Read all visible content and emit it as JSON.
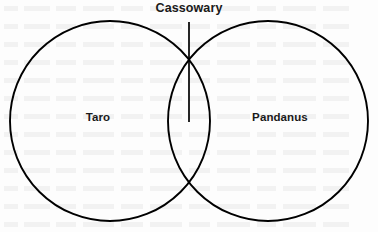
{
  "figure": {
    "type": "venn-diagram",
    "background_color": "#fdfdfd",
    "stroke_color": "#000000",
    "text_color": "#1a1a1a"
  },
  "chart_data": {
    "type": "diagram",
    "diagram_type": "venn",
    "title": "",
    "sets": [
      {
        "id": "taro",
        "label": "Taro",
        "center_x": 110,
        "center_y": 121,
        "radius": 100,
        "fill": "none",
        "stroke": "#000000"
      },
      {
        "id": "pandanus",
        "label": "Pandanus",
        "center_x": 268,
        "center_y": 121,
        "radius": 100,
        "fill": "none",
        "stroke": "#000000"
      }
    ],
    "intersection": {
      "label": "Cassowary",
      "label_x": 190,
      "label_y": 9,
      "leader_line": {
        "x": 189,
        "y_start": 22,
        "y_end": 122
      },
      "upper_crossing": {
        "x": 189,
        "y": 68
      },
      "lower_crossing": {
        "x": 189,
        "y": 182
      }
    },
    "legend": "none",
    "grid": false
  },
  "labels": {
    "cassowary": "Cassowary",
    "taro": "Taro",
    "pandanus": "Pandanus"
  }
}
